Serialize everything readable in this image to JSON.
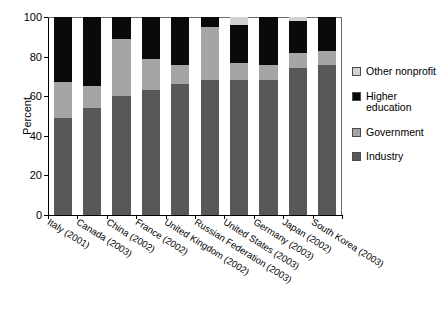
{
  "chart_data": {
    "type": "bar",
    "subtype": "stacked-bar-100",
    "title": "",
    "xlabel": "",
    "ylabel": "Percent",
    "ylim": [
      0,
      100
    ],
    "yticks": [
      0,
      20,
      40,
      60,
      80,
      100
    ],
    "grid": false,
    "legend_position": "right",
    "categories": [
      "Italy (2001)",
      "Canada (2003)",
      "China (2002)",
      "France (2002)",
      "United Kingdom (2002)",
      "Russian Federation (2003)",
      "United States (2003)",
      "Germany (2003)",
      "Japan (2002)",
      "South Korea (2003)"
    ],
    "series": [
      {
        "name": "Industry",
        "color": "#585858",
        "values": [
          49,
          54,
          60,
          63,
          66,
          68,
          68,
          68,
          74,
          76
        ]
      },
      {
        "name": "Government",
        "color": "#a5a5a5",
        "values": [
          18,
          11,
          29,
          16,
          10,
          27,
          9,
          8,
          8,
          7
        ]
      },
      {
        "name": "Higher education",
        "color": "#0a0a0a",
        "values": [
          33,
          35,
          11,
          21,
          24,
          5,
          19,
          24,
          16,
          17
        ]
      },
      {
        "name": "Other nonprofit",
        "color": "#d2d2d2",
        "values": [
          0,
          0,
          0,
          0,
          0,
          0,
          4,
          0,
          2,
          0
        ]
      }
    ]
  },
  "legend": {
    "entries": [
      {
        "label": "Other nonprofit",
        "swatch": "other"
      },
      {
        "label": "Higher education",
        "swatch": "higher"
      },
      {
        "label": "Government",
        "swatch": "government"
      },
      {
        "label": "Industry",
        "swatch": "industry"
      }
    ]
  },
  "colors": {
    "industry": "#585858",
    "government": "#a5a5a5",
    "higher_education": "#0a0a0a",
    "other_nonprofit": "#d2d2d2",
    "axis": "#000000",
    "background": "#ffffff"
  }
}
